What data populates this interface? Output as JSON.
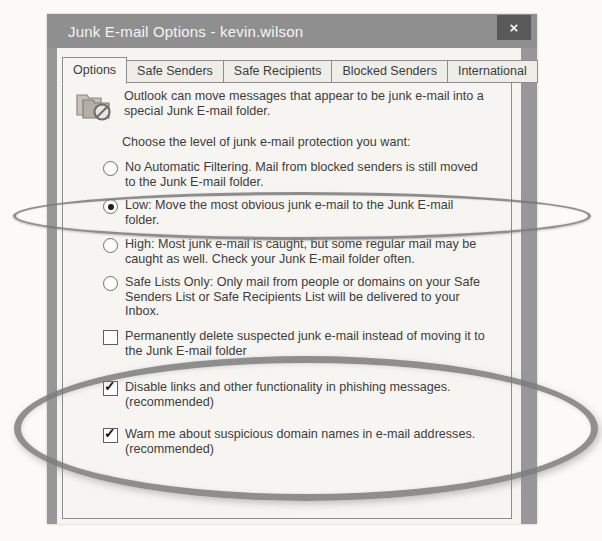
{
  "window": {
    "title": "Junk E-mail Options - kevin.wilson",
    "close_glyph": "×"
  },
  "tabs": [
    {
      "label": "Options",
      "active": true
    },
    {
      "label": "Safe Senders",
      "active": false
    },
    {
      "label": "Safe Recipients",
      "active": false
    },
    {
      "label": "Blocked Senders",
      "active": false
    },
    {
      "label": "International",
      "active": false
    }
  ],
  "intro": {
    "icon": "junk-email-folder-icon",
    "lines": [
      "Outlook can move messages that appear to be junk e-mail into a",
      "special Junk E-mail folder."
    ]
  },
  "prompt": "Choose the level of junk e-mail protection you want:",
  "protection_levels": [
    {
      "selected": false,
      "lines": [
        "No Automatic Filtering. Mail from blocked senders is still moved",
        "to the Junk E-mail folder."
      ]
    },
    {
      "selected": true,
      "lines": [
        "Low: Move the most obvious junk e-mail to the Junk E-mail",
        "folder."
      ]
    },
    {
      "selected": false,
      "lines": [
        "High: Most junk e-mail is caught, but some regular mail may be",
        "caught as well. Check your Junk E-mail folder often."
      ]
    },
    {
      "selected": false,
      "lines": [
        "Safe Lists Only: Only mail from people or domains on your Safe",
        "Senders List or Safe Recipients List will be delivered to your",
        "Inbox."
      ]
    }
  ],
  "checkboxes": [
    {
      "checked": false,
      "lines": [
        "Permanently delete suspected junk e-mail instead of moving it to",
        "the Junk E-mail folder"
      ]
    },
    {
      "checked": true,
      "lines": [
        "Disable links and other functionality in phishing messages.",
        "(recommended)"
      ]
    },
    {
      "checked": true,
      "lines": [
        "Warn me about suspicious domain names in e-mail addresses.",
        "(recommended)"
      ]
    }
  ],
  "glyphs": {
    "check": "✓"
  },
  "annotations": [
    {
      "shape": "ellipse",
      "target": "low-protection-option"
    },
    {
      "shape": "ellipse",
      "target": "phishing-warning-checkboxes"
    }
  ],
  "colors": {
    "titlebar": "#8f8f8f",
    "close_button": "#595959",
    "content_bg": "#f6f4f0",
    "text": "#3d3d3d",
    "annotation": "#7b7b7b"
  }
}
